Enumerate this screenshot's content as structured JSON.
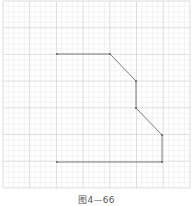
{
  "figure": {
    "caption": "图4—66",
    "grid": {
      "origin_x": 3,
      "origin_y": 1,
      "cell": 26.7,
      "cols": 7,
      "rows": 7,
      "minor_div": 5,
      "major_color": "#c8c8c8",
      "minor_color": "#ececec"
    },
    "polyline": {
      "color": "#7a7a7a",
      "points": [
        [
          57,
          54
        ],
        [
          110,
          54
        ],
        [
          136,
          81
        ],
        [
          136,
          108
        ],
        [
          162,
          135
        ],
        [
          162,
          162
        ],
        [
          57,
          162
        ]
      ]
    }
  }
}
